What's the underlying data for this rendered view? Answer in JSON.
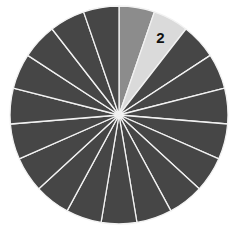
{
  "chart_data": {
    "type": "pie",
    "title": "",
    "start_angle_deg": 0,
    "direction": "clockwise",
    "slice_count": 19,
    "categories": [
      "1",
      "2",
      "3",
      "4",
      "5",
      "6",
      "7",
      "8",
      "9",
      "10",
      "11",
      "12",
      "13",
      "14",
      "15",
      "16",
      "17",
      "18",
      "19"
    ],
    "values": [
      1,
      1,
      1,
      1,
      1,
      1,
      1,
      1,
      1,
      1,
      1,
      1,
      1,
      1,
      1,
      1,
      1,
      1,
      1
    ],
    "colors": [
      "#8c8c8c",
      "#dadada",
      "#464646",
      "#464646",
      "#464646",
      "#464646",
      "#464646",
      "#464646",
      "#464646",
      "#464646",
      "#464646",
      "#464646",
      "#464646",
      "#464646",
      "#464646",
      "#464646",
      "#464646",
      "#464646",
      "#464646"
    ],
    "labels": [
      {
        "slice_index": 1,
        "text": "2"
      }
    ],
    "separator_color": "#f2f2f2",
    "legend": "none"
  }
}
